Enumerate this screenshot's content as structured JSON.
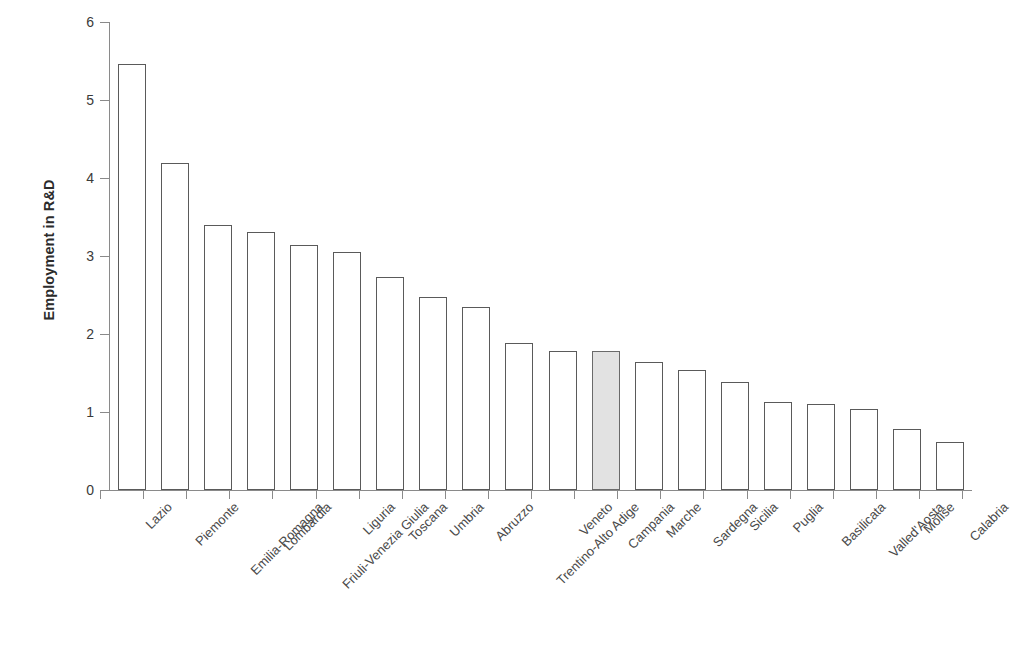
{
  "chart_data": {
    "type": "bar",
    "title": "",
    "xlabel": "",
    "ylabel": "Employment in R&D",
    "ylim": [
      0,
      6
    ],
    "yticks": [
      "0",
      "1",
      "2",
      "3",
      "4",
      "5",
      "6"
    ],
    "grid": false,
    "legend": "none",
    "highlight_category": "Campania",
    "highlight_color": "#e2e2e2",
    "bar_fill": "#ffffff",
    "bar_border": "#5a5a5a",
    "axis_color": "#8a8a8a",
    "categories": [
      "Lazio",
      "Piemonte",
      "Emilia-Romagna",
      "Lombardia",
      "Friuli-Venezia Giulia",
      "Liguria",
      "Toscana",
      "Umbria",
      "Abruzzo",
      "Trentino-Alto Adige",
      "Veneto",
      "Campania",
      "Marche",
      "Sardegna",
      "Sicilia",
      "Puglia",
      "Basilicata",
      "Valled'Aosta",
      "Molise",
      "Calabria"
    ],
    "values": [
      5.46,
      4.19,
      3.4,
      3.31,
      3.14,
      3.05,
      2.73,
      2.47,
      2.34,
      1.89,
      1.78,
      1.78,
      1.64,
      1.54,
      1.39,
      1.13,
      1.1,
      1.04,
      0.78,
      0.61
    ]
  }
}
